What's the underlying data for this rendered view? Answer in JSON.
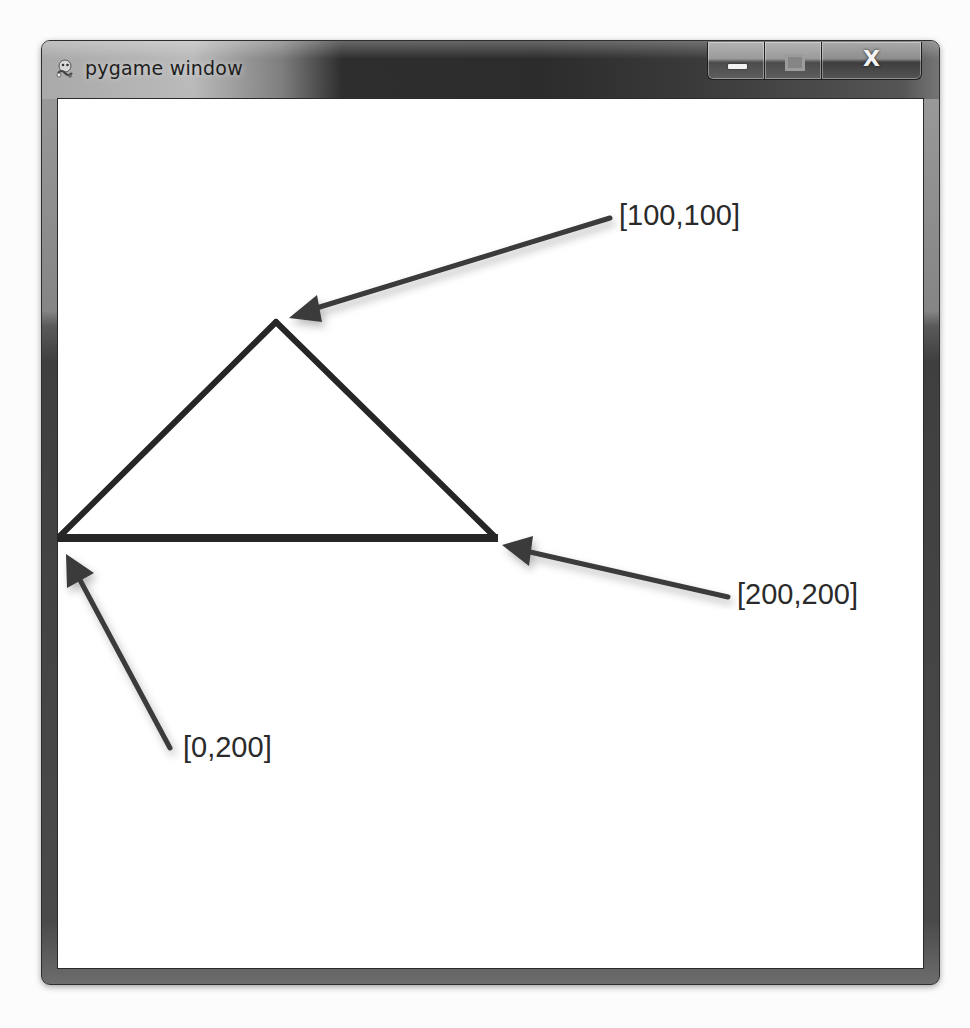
{
  "window": {
    "title": "pygame window",
    "icon": "pygame-snake-icon",
    "controls": {
      "minimize": {
        "icon": "minimize-icon",
        "label": "Minimize"
      },
      "maximize": {
        "icon": "maximize-icon",
        "label": "Maximize"
      },
      "close": {
        "icon": "close-icon",
        "glyph": "X",
        "label": "Close"
      }
    }
  },
  "canvas": {
    "background": "#ffffff",
    "shape": {
      "type": "polygon",
      "stroke": "#262626",
      "stroke_width": 6,
      "points_screen": [
        [
          276,
          320
        ],
        [
          497,
          538
        ],
        [
          57,
          538
        ]
      ],
      "points_logical": [
        [
          100,
          100
        ],
        [
          200,
          200
        ],
        [
          0,
          200
        ]
      ]
    },
    "annotations": [
      {
        "label": "[100,100]",
        "arrow": "arrow-to-top-vertex"
      },
      {
        "label": "[200,200]",
        "arrow": "arrow-to-right-vertex"
      },
      {
        "label": "[0,200]",
        "arrow": "arrow-to-left-vertex"
      }
    ],
    "arrow_color": "#3a3a3a"
  }
}
